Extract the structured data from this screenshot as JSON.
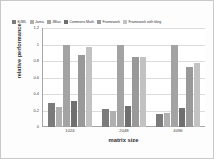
{
  "chart_data": {
    "type": "bar",
    "title": "",
    "xlabel": "matrix size",
    "ylabel": "relative performance",
    "categories": [
      "1024",
      "2048",
      "4096"
    ],
    "ylim": [
      0,
      1.2
    ],
    "yticks": [
      "0",
      "0.2",
      "0.4",
      "0.6",
      "0.8",
      "1",
      "1.2"
    ],
    "grid": true,
    "legend_position": "top",
    "series": [
      {
        "name": "EJML",
        "color": "#7b7b7b",
        "values": [
          0.29,
          0.22,
          0.16
        ]
      },
      {
        "name": "Jama",
        "color": "#b0b0b0",
        "values": [
          0.24,
          0.19,
          0.17
        ]
      },
      {
        "name": "JBlas",
        "color": "#a3a3a3",
        "values": [
          1.0,
          1.0,
          1.0
        ]
      },
      {
        "name": "Commons Math",
        "color": "#6f6f6f",
        "values": [
          0.31,
          0.26,
          0.23
        ]
      },
      {
        "name": "Framework",
        "color": "#999999",
        "values": [
          0.87,
          0.85,
          0.73
        ]
      },
      {
        "name": "Framework with tiling",
        "color": "#c2c2c2",
        "values": [
          0.97,
          0.85,
          0.77
        ]
      }
    ]
  }
}
